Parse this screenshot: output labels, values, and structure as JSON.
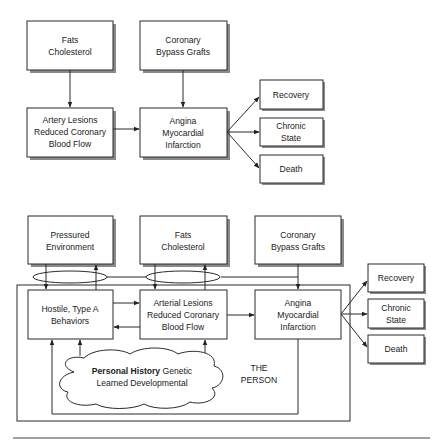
{
  "top_diagram": {
    "fats": [
      "Fats",
      "Cholesterol"
    ],
    "bypass": [
      "Coronary",
      "Bypass Grafts"
    ],
    "lesions": [
      "Artery Lesions",
      "Reduced Coronary",
      "Blood Flow"
    ],
    "angina": [
      "Angina",
      "Myocardial",
      "Infarction"
    ],
    "outcomes": {
      "recovery": [
        "Recovery"
      ],
      "chronic": [
        "Chronic",
        "State"
      ],
      "death": [
        "Death"
      ]
    }
  },
  "bottom_diagram": {
    "pressured": [
      "Pressured",
      "Environment"
    ],
    "fats": [
      "Fats",
      "Cholesterol"
    ],
    "bypass": [
      "Coronary",
      "Bypass Grafts"
    ],
    "hostile": [
      "Hostile, Type A",
      "Behaviors"
    ],
    "lesions": [
      "Arterial Lesions",
      "Reduced Coronary",
      "Blood Flow"
    ],
    "angina": [
      "Angina",
      "Myocardial",
      "Infarction"
    ],
    "history": {
      "bold": "Personal History",
      "line1_rest": " Genetic",
      "line2": "Learned Developmental"
    },
    "person_label": [
      "THE",
      "PERSON"
    ],
    "outcomes": {
      "recovery": [
        "Recovery"
      ],
      "chronic": [
        "Chronic",
        "State"
      ],
      "death": [
        "Death"
      ]
    }
  }
}
